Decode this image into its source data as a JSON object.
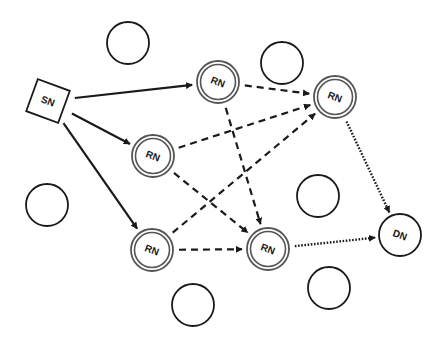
{
  "diagram": {
    "colors": {
      "stroke": "#1a1a1a",
      "relay_ring": "#555555",
      "background": "#ffffff"
    },
    "nodes": [
      {
        "id": "SN",
        "label": "SN",
        "type": "source",
        "x": 48,
        "y": 101
      },
      {
        "id": "RN1",
        "label": "RN",
        "type": "relay",
        "x": 218,
        "y": 82
      },
      {
        "id": "RN2",
        "label": "RN",
        "type": "relay",
        "x": 153,
        "y": 156
      },
      {
        "id": "RN3",
        "label": "RN",
        "type": "relay",
        "x": 335,
        "y": 97
      },
      {
        "id": "RN4",
        "label": "RN",
        "type": "relay",
        "x": 152,
        "y": 250
      },
      {
        "id": "RN5",
        "label": "RN",
        "type": "relay",
        "x": 268,
        "y": 249
      },
      {
        "id": "DN",
        "label": "DN",
        "type": "destination",
        "x": 400,
        "y": 235
      },
      {
        "id": "E1",
        "label": "",
        "type": "idle",
        "x": 128,
        "y": 43
      },
      {
        "id": "E2",
        "label": "",
        "type": "idle",
        "x": 282,
        "y": 63
      },
      {
        "id": "E3",
        "label": "",
        "type": "idle",
        "x": 318,
        "y": 196
      },
      {
        "id": "E4",
        "label": "",
        "type": "idle",
        "x": 47,
        "y": 205
      },
      {
        "id": "E5",
        "label": "",
        "type": "idle",
        "x": 329,
        "y": 288
      },
      {
        "id": "E6",
        "label": "",
        "type": "idle",
        "x": 193,
        "y": 305
      }
    ],
    "edges": [
      {
        "from": "SN",
        "to": "RN1",
        "style": "solid"
      },
      {
        "from": "SN",
        "to": "RN2",
        "style": "solid"
      },
      {
        "from": "SN",
        "to": "RN4",
        "style": "solid"
      },
      {
        "from": "RN1",
        "to": "RN3",
        "style": "dashed"
      },
      {
        "from": "RN1",
        "to": "RN5",
        "style": "dashed"
      },
      {
        "from": "RN2",
        "to": "RN3",
        "style": "dashed"
      },
      {
        "from": "RN2",
        "to": "RN5",
        "style": "dashed"
      },
      {
        "from": "RN4",
        "to": "RN3",
        "style": "dashed"
      },
      {
        "from": "RN4",
        "to": "RN5",
        "style": "dashed"
      },
      {
        "from": "RN3",
        "to": "DN",
        "style": "dotted"
      },
      {
        "from": "RN5",
        "to": "DN",
        "style": "dotted"
      }
    ]
  }
}
